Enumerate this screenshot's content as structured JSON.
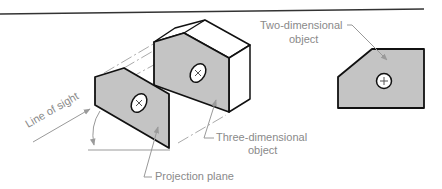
{
  "diagram": {
    "title": "",
    "colors": {
      "face_fill": "#c4c4c4",
      "outline": "#111111",
      "annotation": "#8a8a8a",
      "arrow_fill": "#9a9a9a",
      "rule": "#333333"
    },
    "labels": {
      "line_of_sight": "Line of sight",
      "two_dimensional_1": "Two-dimensional",
      "two_dimensional_2": "object",
      "three_dimensional_1": "Three-dimensional",
      "three_dimensional_2": "object",
      "projection_plane": "Projection plane"
    },
    "elements": [
      {
        "id": "projection-plane",
        "type": "parallelogram-plate",
        "symbol": "x-circle"
      },
      {
        "id": "three-dimensional-object",
        "type": "prism",
        "symbol": "x-circle"
      },
      {
        "id": "two-dimensional-object",
        "type": "polygon",
        "symbol": "plus-circle"
      }
    ]
  }
}
